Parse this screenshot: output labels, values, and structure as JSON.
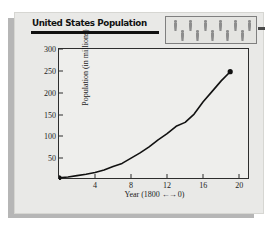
{
  "card": {
    "title": "United States Population",
    "side_dash_icon": "dash-icon"
  },
  "icon_panel": {
    "icon_name": "person-icon",
    "count": 11,
    "color": "#8d8d8d",
    "border_color": "#7f7f7f"
  },
  "chart_data": {
    "type": "line",
    "title": "United States Population",
    "xlabel": "Year (1800 ←→ 0)",
    "ylabel": "Population (in millions)",
    "xlim": [
      0,
      21.2
    ],
    "ylim": [
      0,
      300
    ],
    "xticks": [
      4,
      8,
      12,
      16,
      20
    ],
    "xtick_labels": [
      "4",
      "8",
      "12",
      "16",
      "20"
    ],
    "yticks": [
      50,
      100,
      150,
      200,
      250,
      300
    ],
    "ytick_labels": [
      "50",
      "100",
      "150",
      "200",
      "250",
      "300"
    ],
    "grid": false,
    "legend": null,
    "line_color": "#111111",
    "marker_color": "#111111",
    "series": [
      {
        "name": "United States Population",
        "x": [
          0,
          1,
          2,
          3,
          4,
          5,
          6,
          7,
          8,
          9,
          10,
          11,
          12,
          13,
          14,
          15,
          16,
          17,
          18,
          19
        ],
        "values": [
          5,
          7,
          10,
          13,
          17,
          23,
          31,
          38,
          50,
          62,
          76,
          92,
          106,
          123,
          132,
          151,
          179,
          203,
          227,
          248
        ]
      }
    ],
    "endpoints": [
      {
        "label": "start",
        "x": 0,
        "y": 5
      },
      {
        "label": "end",
        "x": 19,
        "y": 248
      }
    ]
  }
}
